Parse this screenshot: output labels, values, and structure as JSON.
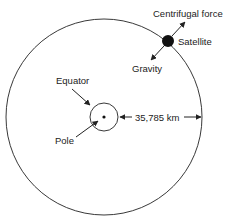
{
  "diagram": {
    "labels": {
      "centrifugal": "Centrifugal force",
      "satellite": "Satellite",
      "gravity": "Gravity",
      "equator": "Equator",
      "pole": "Pole",
      "distance": "35,785 km"
    },
    "colors": {
      "stroke": "#222222",
      "satellite_fill": "#111111",
      "background": "#ffffff"
    }
  }
}
